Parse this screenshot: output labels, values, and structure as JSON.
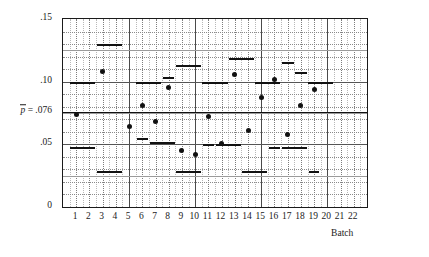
{
  "chart_data": {
    "type": "scatter",
    "title": "",
    "xlabel": "Batch",
    "ylabel": "",
    "ylim": [
      0,
      0.15
    ],
    "xlim": [
      0,
      23
    ],
    "grid": true,
    "legend": false,
    "center_line": {
      "label_text": "= .076",
      "label_symbol": "p",
      "value": 0.076
    },
    "ytick_labels": [
      "0",
      ".05",
      ".10",
      ".15"
    ],
    "ytick_values": [
      0,
      0.05,
      0.1,
      0.15
    ],
    "yminor_values": [
      0.01,
      0.02,
      0.03,
      0.04,
      0.06,
      0.07,
      0.08,
      0.09,
      0.11,
      0.12,
      0.13,
      0.14
    ],
    "ymid_values": [
      0.025,
      0.075,
      0.125
    ],
    "xtick_labels": [
      "1",
      "2",
      "3",
      "4",
      "5",
      "6",
      "7",
      "8",
      "9",
      "10",
      "11",
      "12",
      "13",
      "14",
      "15",
      "16",
      "17",
      "18",
      "19",
      "20",
      "21",
      "22"
    ],
    "xmajor_values": [
      5,
      10,
      15,
      20
    ],
    "categories": [
      "1",
      "2",
      "3",
      "4",
      "5",
      "6",
      "7",
      "8",
      "9",
      "10",
      "11",
      "12",
      "13",
      "14",
      "15",
      "16",
      "17",
      "18",
      "19",
      "20",
      "21",
      "22"
    ],
    "series": [
      {
        "name": "sample proportion",
        "x": [
          1,
          3,
          5,
          6,
          7,
          8,
          9,
          10,
          11,
          12,
          13,
          14,
          15,
          16,
          17,
          18,
          19
        ],
        "values": [
          0.074,
          0.108,
          0.064,
          0.081,
          0.068,
          0.095,
          0.045,
          0.042,
          0.072,
          0.051,
          0.106,
          0.061,
          0.087,
          0.102,
          0.058,
          0.081,
          0.094
        ]
      }
    ],
    "control_limits": [
      {
        "batch": 1,
        "upper": 0.1,
        "lower": 0.048
      },
      {
        "batch": 2,
        "upper": 0.1,
        "lower": 0.048
      },
      {
        "batch": 3,
        "upper": 0.13,
        "lower": 0.029
      },
      {
        "batch": 4,
        "upper": 0.13,
        "lower": 0.029
      },
      {
        "batch": 6,
        "upper": 0.1,
        "lower": 0.048
      },
      {
        "batch": 7,
        "upper": 0.1,
        "lower": 0.048
      },
      {
        "batch": 8,
        "upper": 0.104,
        "lower": 0.055
      },
      {
        "batch": 9,
        "upper": 0.113,
        "lower": 0.052
      },
      {
        "batch": 10,
        "upper": 0.113,
        "lower": 0.052
      },
      {
        "batch": 11,
        "upper": 0.1,
        "lower": 0.05
      },
      {
        "batch": 12,
        "upper": 0.1,
        "lower": 0.05
      },
      {
        "batch": 13,
        "upper": 0.119,
        "lower": 0.029
      },
      {
        "batch": 14,
        "upper": 0.119,
        "lower": 0.029
      },
      {
        "batch": 15,
        "upper": 0.1,
        "lower": 0.05
      },
      {
        "batch": 16,
        "upper": 0.1,
        "lower": 0.05
      },
      {
        "batch": 17,
        "upper": 0.116,
        "lower": 0.029
      },
      {
        "batch": 18,
        "upper": 0.108,
        "lower": 0.048
      },
      {
        "batch": 19,
        "upper": 0.1,
        "lower": 0.048
      },
      {
        "batch": 20,
        "upper": 0.1,
        "lower": 0.048
      }
    ],
    "limit_segments": [
      {
        "x_start": 0.55,
        "x_end": 2.45,
        "y": 0.1
      },
      {
        "x_start": 2.55,
        "x_end": 4.45,
        "y": 0.13
      },
      {
        "x_start": 5.55,
        "x_end": 7.45,
        "y": 0.1
      },
      {
        "x_start": 7.6,
        "x_end": 8.4,
        "y": 0.104
      },
      {
        "x_start": 8.55,
        "x_end": 10.45,
        "y": 0.113
      },
      {
        "x_start": 10.55,
        "x_end": 12.45,
        "y": 0.1
      },
      {
        "x_start": 12.55,
        "x_end": 14.45,
        "y": 0.119
      },
      {
        "x_start": 14.55,
        "x_end": 16.45,
        "y": 0.1
      },
      {
        "x_start": 16.55,
        "x_end": 17.45,
        "y": 0.116
      },
      {
        "x_start": 17.55,
        "x_end": 18.45,
        "y": 0.108
      },
      {
        "x_start": 18.55,
        "x_end": 20.45,
        "y": 0.1
      },
      {
        "x_start": 0.55,
        "x_end": 2.45,
        "y": 0.048
      },
      {
        "x_start": 2.55,
        "x_end": 4.45,
        "y": 0.029
      },
      {
        "x_start": 5.6,
        "x_end": 6.4,
        "y": 0.055
      },
      {
        "x_start": 6.55,
        "x_end": 8.45,
        "y": 0.052
      },
      {
        "x_start": 8.55,
        "x_end": 10.45,
        "y": 0.029
      },
      {
        "x_start": 10.6,
        "x_end": 11.4,
        "y": 0.05
      },
      {
        "x_start": 11.55,
        "x_end": 13.45,
        "y": 0.05
      },
      {
        "x_start": 13.55,
        "x_end": 15.45,
        "y": 0.029
      },
      {
        "x_start": 15.6,
        "x_end": 16.4,
        "y": 0.048
      },
      {
        "x_start": 16.55,
        "x_end": 18.45,
        "y": 0.048
      },
      {
        "x_start": 18.6,
        "x_end": 19.4,
        "y": 0.029
      }
    ]
  }
}
